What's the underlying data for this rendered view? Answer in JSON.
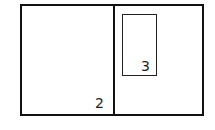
{
  "diagram": {
    "regions": [
      {
        "id": "left-panel",
        "label": "2"
      },
      {
        "id": "inner-box",
        "label": "3"
      }
    ],
    "colors": {
      "stroke": "#111111",
      "background": "#ffffff"
    }
  }
}
